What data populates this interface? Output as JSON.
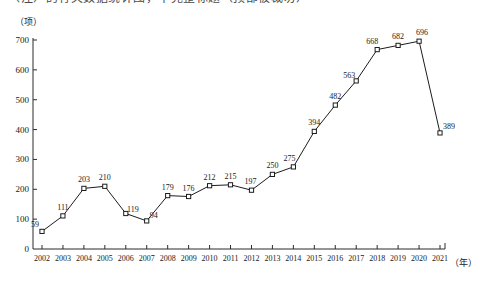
{
  "title": "（注）的有关数据统计图，不完整标题（顶部被裁切）",
  "axes": {
    "y_unit": "（项）",
    "x_unit": "（年）"
  },
  "chart_data": {
    "type": "line",
    "title": "",
    "xlabel": "年",
    "ylabel": "项",
    "categories": [
      "2002",
      "2003",
      "2004",
      "2005",
      "2006",
      "2007",
      "2008",
      "2009",
      "2010",
      "2011",
      "2012",
      "2013",
      "2014",
      "2015",
      "2016",
      "2017",
      "2018",
      "2019",
      "2020",
      "2021"
    ],
    "values": [
      59,
      111,
      203,
      210,
      119,
      94,
      179,
      176,
      212,
      215,
      197,
      250,
      275,
      394,
      482,
      563,
      668,
      682,
      696,
      389
    ],
    "series": [
      {
        "name": "数量",
        "values": [
          59,
          111,
          203,
          210,
          119,
          94,
          179,
          176,
          212,
          215,
          197,
          250,
          275,
          394,
          482,
          563,
          668,
          682,
          696,
          389
        ]
      }
    ],
    "ylim": [
      0,
      700
    ],
    "y_ticks": [
      0,
      100,
      200,
      300,
      400,
      500,
      600,
      700
    ],
    "y_tick_labels": [
      "0",
      "100",
      "200",
      "300",
      "400",
      "500",
      "600",
      "700"
    ],
    "grid": false,
    "legend": "none",
    "marker": "open-square",
    "data_labels": true,
    "line_color": "#1c1c1c",
    "marker_fill": "#ffffff"
  }
}
